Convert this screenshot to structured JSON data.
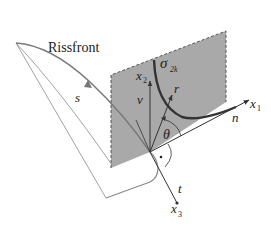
{
  "diagram": {
    "title_label": "Rissfront",
    "labels": {
      "s": "s",
      "x1": "x",
      "x1_sub": "1",
      "x2": "x",
      "x2_sub": "2",
      "x3": "x",
      "x3_sub": "3",
      "v": "v",
      "r": "r",
      "n": "n",
      "t": "t",
      "theta": "θ",
      "sigma": "σ",
      "sigma_sub": "2k"
    },
    "colors": {
      "plane_fill": "#a9a9a9",
      "plane_edge": "#555555",
      "crack_front": "#7a7a7a",
      "stress_curve": "#333333",
      "axis": "#333333",
      "thin_lines": "#8a8a8a"
    }
  }
}
